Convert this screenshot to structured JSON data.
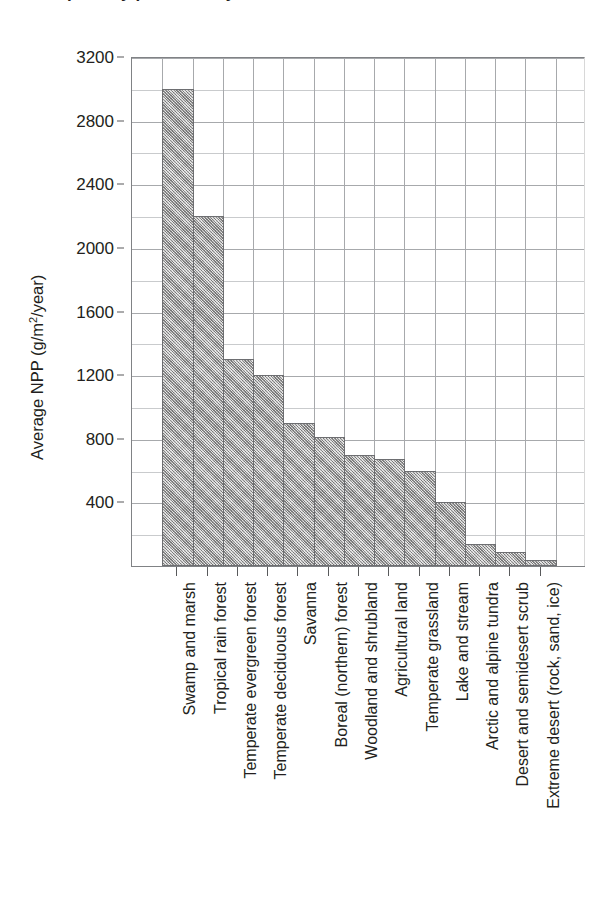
{
  "figure": {
    "title_clipped": "Net primary productivity",
    "y_axis_title_main": "Average NPP (g/m",
    "y_axis_title_sup": "2",
    "y_axis_title_tail": "/year)"
  },
  "chart_data": {
    "type": "bar",
    "title": "Net primary productivity",
    "xlabel": "",
    "ylabel": "Average NPP (g/m2/year)",
    "ylim": [
      0,
      3200
    ],
    "ytick_step": 400,
    "yminor_step": 200,
    "grid": true,
    "legend": "none",
    "orientation": "vertical",
    "bar_fill": "#b0b0b0",
    "bar_border": "#6d6e71",
    "grid_color": "#a7a9ac",
    "axis_color": "#808285",
    "tick_labels": [
      "400",
      "800",
      "1200",
      "1600",
      "2000",
      "2400",
      "2800",
      "3200"
    ],
    "ticks": [
      400,
      800,
      1200,
      1600,
      2000,
      2400,
      2800,
      3200
    ],
    "categories": [
      "Swamp and marsh",
      "Tropical rain forest",
      "Temperate evergreen forest",
      "Temperate deciduous forest",
      "Savanna",
      "Boreal (northern) forest",
      "Woodland and shrubland",
      "Agricultural land",
      "Temperate grassland",
      "Lake and stream",
      "Arctic and alpine tundra",
      "Desert and semidesert scrub",
      "Extreme desert (rock, sand, ice)"
    ],
    "values": [
      3000,
      2200,
      1300,
      1200,
      900,
      810,
      700,
      670,
      600,
      400,
      140,
      90,
      40
    ]
  }
}
